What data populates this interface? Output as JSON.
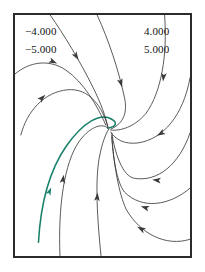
{
  "figure": {
    "kind": "phase-portrait",
    "frame": {
      "x": 13,
      "y": 13,
      "width": 179,
      "height": 245
    },
    "border_color": "#2b2b2b",
    "background": "#ffffff"
  },
  "labels": {
    "top_left": "−4.000",
    "mid_left": "−5.000",
    "top_right": "4.000",
    "mid_right": "5.000"
  },
  "chart_data": {
    "type": "line",
    "title": "",
    "xlabel": "",
    "ylabel": "",
    "grid": false,
    "legend": null,
    "annotations": [
      {
        "text": "−4.000",
        "position": "top-left"
      },
      {
        "text": "−5.000",
        "position": "upper-left"
      },
      {
        "text": "4.000",
        "position": "top-right"
      },
      {
        "text": "5.000",
        "position": "upper-right"
      }
    ],
    "critical_point": {
      "x": 95,
      "y": 115,
      "type": "node"
    },
    "curve_color": "#3a3a3a",
    "highlight_color": "#19806b",
    "series": [
      {
        "name": "trajectory-highlighted",
        "color": "#19806b",
        "highlighted": true,
        "path": "M 24 231 C 26 196, 34 160, 52 134 C 70 108, 88 99, 99 106 C 104 109, 105 113, 95 115",
        "arrows": [
          {
            "x": 35,
            "y": 180,
            "angle": -66
          }
        ]
      },
      {
        "name": "trajectory-upper-left-outer",
        "color": "#3a3a3a",
        "highlighted": false,
        "path": "M 0 60 C 14 48, 34 44, 52 56 C 70 68, 84 92, 93 112",
        "arrows": [
          {
            "x": 38,
            "y": 47,
            "angle": 24
          }
        ]
      },
      {
        "name": "trajectory-upper-left-inner",
        "color": "#3a3a3a",
        "highlighted": false,
        "path": "M 36 0 C 50 20, 66 46, 80 74 C 88 90, 93 104, 95 114",
        "arrows": [
          {
            "x": 62,
            "y": 41,
            "angle": 58
          }
        ]
      },
      {
        "name": "trajectory-left-arc",
        "color": "#3a3a3a",
        "highlighted": false,
        "path": "M 6 122 C 12 98, 30 78, 54 76 C 76 74, 90 94, 95 114",
        "arrows": [
          {
            "x": 27,
            "y": 85,
            "angle": -44
          }
        ]
      },
      {
        "name": "trajectory-left-hump",
        "color": "#3a3a3a",
        "highlighted": false,
        "path": "M 46 245 C 44 196, 50 150, 66 128 C 78 112, 90 110, 95 115",
        "arrows": [
          {
            "x": 49,
            "y": 168,
            "angle": -82
          }
        ]
      },
      {
        "name": "trajectory-bottom-left",
        "color": "#3a3a3a",
        "highlighted": false,
        "path": "M 88 245 C 84 206, 82 170, 86 146 C 89 130, 93 120, 96 116",
        "arrows": [
          {
            "x": 84,
            "y": 186,
            "angle": -85
          }
        ]
      },
      {
        "name": "trajectory-top-center",
        "color": "#3a3a3a",
        "highlighted": false,
        "path": "M 84 0 C 96 26, 106 56, 112 84 C 115 98, 112 110, 98 116",
        "arrows": [
          {
            "x": 108,
            "y": 68,
            "angle": 74
          }
        ]
      },
      {
        "name": "trajectory-top-right-outer",
        "color": "#3a3a3a",
        "highlighted": false,
        "path": "M 153 0 C 156 40, 150 78, 134 100 C 122 114, 108 118, 98 117",
        "arrows": [
          {
            "x": 152,
            "y": 62,
            "angle": 96
          }
        ]
      },
      {
        "name": "trajectory-right-upper",
        "color": "#3a3a3a",
        "highlighted": false,
        "path": "M 179 64 C 172 102, 152 126, 126 130 C 112 132, 102 126, 98 119",
        "arrows": [
          {
            "x": 150,
            "y": 120,
            "angle": 150
          }
        ]
      },
      {
        "name": "trajectory-right-mid",
        "color": "#3a3a3a",
        "highlighted": false,
        "path": "M 179 120 C 168 152, 146 170, 122 166 C 110 164, 102 140, 99 120",
        "arrows": [
          {
            "x": 146,
            "y": 168,
            "angle": 186
          }
        ]
      },
      {
        "name": "trajectory-right-lower",
        "color": "#3a3a3a",
        "highlighted": false,
        "path": "M 179 176 C 158 194, 130 198, 112 180 C 104 170, 100 144, 99 122",
        "arrows": [
          {
            "x": 134,
            "y": 196,
            "angle": 196
          }
        ]
      },
      {
        "name": "trajectory-bottom-right",
        "color": "#3a3a3a",
        "highlighted": false,
        "path": "M 179 228 C 154 236, 128 222, 114 198 C 106 182, 101 150, 99 124",
        "arrows": [
          {
            "x": 130,
            "y": 218,
            "angle": 208
          }
        ]
      }
    ]
  }
}
